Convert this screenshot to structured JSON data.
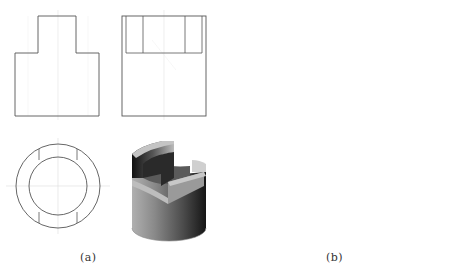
{
  "figure": {
    "panels": [
      {
        "id": "a",
        "caption": "(a)",
        "views": [
          "front-view",
          "side-view",
          "top-view",
          "isometric-render"
        ],
        "description": "Cylinder with two opposite slots cut from the top, leaving a central tongue in front view"
      },
      {
        "id": "b",
        "caption": "(b)",
        "views": [
          "front-view",
          "side-view",
          "top-view",
          "isometric-render"
        ],
        "description": "Cylinder with central U-slot in front view and stepped side profile"
      }
    ],
    "colors": {
      "line": "#555555",
      "centerline": "#d0d0d0",
      "shade_dark": "#1e1e1e",
      "shade_mid": "#7a7a7a",
      "shade_light": "#c8c8c8",
      "face_top": "#bdbdbd"
    }
  }
}
